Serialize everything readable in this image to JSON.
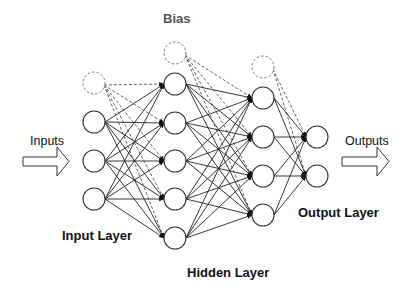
{
  "labels": {
    "bias": "Bias",
    "inputs": "Inputs",
    "outputs": "Outputs",
    "input_layer": "Input Layer",
    "hidden_layer": "Hidden Layer",
    "output_layer": "Output Layer"
  },
  "style": {
    "node_stroke": "#333333",
    "bias_stroke": "#777777",
    "edge_color": "#222222",
    "bias_label_color": "#555555"
  },
  "network": {
    "node_radius": 11,
    "layers": [
      {
        "name": "input",
        "x": 94,
        "nodes_y": [
          122,
          161,
          199
        ],
        "bias_y": 83
      },
      {
        "name": "hidden-1",
        "x": 175,
        "nodes_y": [
          84,
          123,
          161,
          199,
          238
        ],
        "bias_y": 53
      },
      {
        "name": "hidden-2",
        "x": 263,
        "nodes_y": [
          98,
          137,
          176,
          215
        ],
        "bias_y": 67
      },
      {
        "name": "output",
        "x": 317,
        "nodes_y": [
          137,
          176
        ],
        "bias_y": null
      }
    ]
  }
}
